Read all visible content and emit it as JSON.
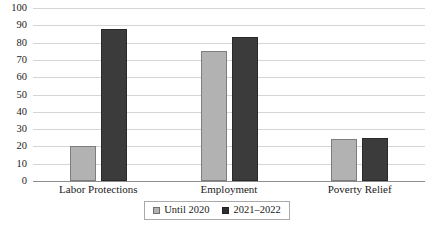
{
  "chart_data": {
    "type": "bar",
    "title": "",
    "subtitle": "",
    "xlabel": "",
    "ylabel": "",
    "ylim": [
      0,
      100
    ],
    "ytick_labels": [
      "100",
      "90",
      "80",
      "70",
      "60",
      "50",
      "40",
      "30",
      "20",
      "10",
      "0"
    ],
    "ytick_values": [
      100,
      90,
      80,
      70,
      60,
      50,
      40,
      30,
      20,
      10,
      0
    ],
    "grid": true,
    "legend_position": "bottom-center",
    "categories": [
      "Labor Protections",
      "Employment",
      "Poverty Relief"
    ],
    "series": [
      {
        "name": "Until 2020",
        "color": "#b2b2b2",
        "values": [
          20,
          75,
          24
        ]
      },
      {
        "name": "2021–2022",
        "color": "#3b3b3b",
        "values": [
          88,
          83,
          25
        ]
      }
    ]
  },
  "legend": {
    "entries": [
      {
        "label": "Until 2020"
      },
      {
        "label": "2021–2022"
      }
    ]
  },
  "colors": {
    "series_until_2020": "#b2b2b2",
    "series_2021_2022": "#3b3b3b",
    "gridline": "#d5d5d5",
    "axis": "#8d8d8d",
    "background": "#ffffff",
    "text": "#1a1a1a"
  }
}
